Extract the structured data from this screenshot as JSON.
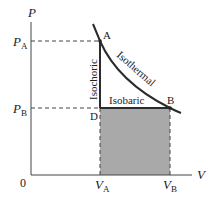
{
  "diagram": {
    "axes": {
      "y_label": "P",
      "x_label": "V",
      "origin_label": "0"
    },
    "ticks": {
      "pa_main": "P",
      "pa_sub": "A",
      "pb_main": "P",
      "pb_sub": "B",
      "va_main": "V",
      "va_sub": "A",
      "vb_main": "V",
      "vb_sub": "B"
    },
    "points": {
      "a": "A",
      "b": "B",
      "d": "D"
    },
    "processes": {
      "isochoric": "Isochoric",
      "isothermal": "Isothermal",
      "isobaric": "Isobaric"
    },
    "colors": {
      "shaded_area": "#a9a9a9",
      "line": "#2b2b2b"
    }
  }
}
